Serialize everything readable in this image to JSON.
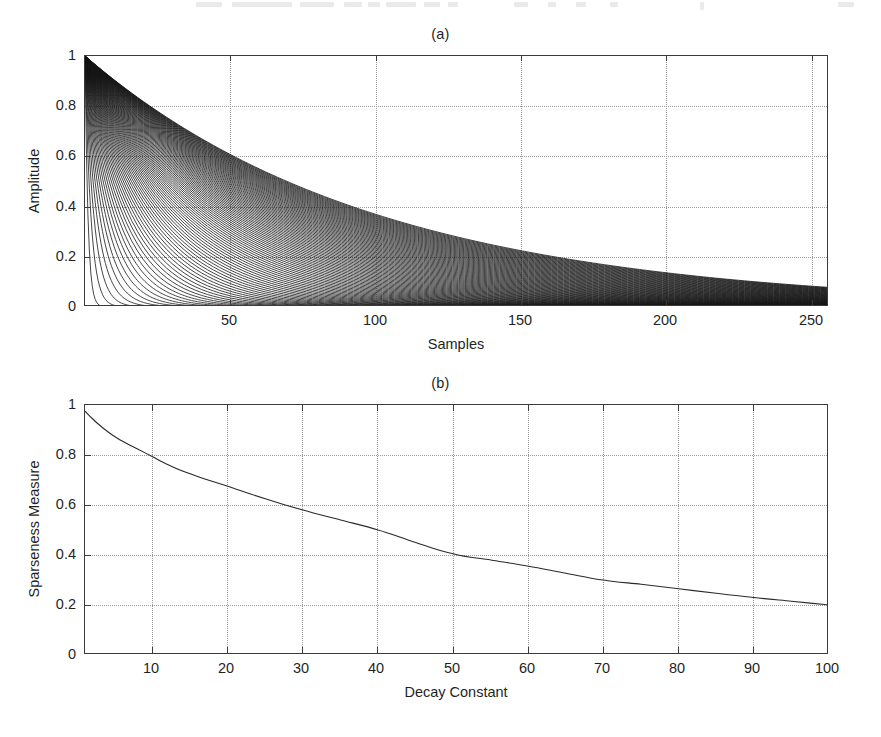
{
  "figure": {
    "background": "#ffffff",
    "axis_color": "#3b3b3b",
    "grid_color": "#9a9a9a",
    "curve_color": "#1a1a1a"
  },
  "panel_a": {
    "title": "(a)",
    "xlabel": "Samples",
    "ylabel": "Amplitude",
    "xticks": [
      "50",
      "100",
      "150",
      "200",
      "250"
    ],
    "yticks": [
      "0",
      "0.2",
      "0.4",
      "0.6",
      "0.8",
      "1"
    ]
  },
  "panel_b": {
    "title": "(b)",
    "xlabel": "Decay Constant",
    "ylabel": "Sparseness Measure",
    "xticks": [
      "10",
      "20",
      "30",
      "40",
      "50",
      "60",
      "70",
      "80",
      "90",
      "100"
    ],
    "yticks": [
      "0",
      "0.2",
      "0.4",
      "0.6",
      "0.8",
      "1"
    ]
  },
  "chart_data": [
    {
      "type": "line",
      "panel": "a",
      "title": "(a)",
      "xlabel": "Samples",
      "ylabel": "Amplitude",
      "xlim": [
        1,
        256
      ],
      "ylim": [
        0,
        1
      ],
      "xticks": [
        50,
        100,
        150,
        200,
        250
      ],
      "yticks": [
        0,
        0.2,
        0.4,
        0.6,
        0.8,
        1
      ],
      "grid": true,
      "legend": "none",
      "description": "Family of 100 exponential decay envelopes exp(-(n-1)/tau), tau = 1..100, each starting at amplitude 1 at sample 1; the slowest (tau=100) forms the upper envelope reaching about 0.08 at sample 256.",
      "series_count": 100,
      "series_model": "amplitude(n, tau) = exp(-(n-1)/tau)",
      "tau_values": [
        1,
        2,
        3,
        4,
        5,
        6,
        7,
        8,
        9,
        10,
        11,
        12,
        13,
        14,
        15,
        16,
        17,
        18,
        19,
        20,
        21,
        22,
        23,
        24,
        25,
        26,
        27,
        28,
        29,
        30,
        31,
        32,
        33,
        34,
        35,
        36,
        37,
        38,
        39,
        40,
        41,
        42,
        43,
        44,
        45,
        46,
        47,
        48,
        49,
        50,
        51,
        52,
        53,
        54,
        55,
        56,
        57,
        58,
        59,
        60,
        61,
        62,
        63,
        64,
        65,
        66,
        67,
        68,
        69,
        70,
        71,
        72,
        73,
        74,
        75,
        76,
        77,
        78,
        79,
        80,
        81,
        82,
        83,
        84,
        85,
        86,
        87,
        88,
        89,
        90,
        91,
        92,
        93,
        94,
        95,
        96,
        97,
        98,
        99,
        100
      ],
      "envelope_x": [
        1,
        25,
        50,
        75,
        100,
        125,
        150,
        175,
        200,
        225,
        256
      ],
      "envelope_y": [
        1.0,
        0.787,
        0.613,
        0.478,
        0.372,
        0.29,
        0.226,
        0.176,
        0.137,
        0.106,
        0.078
      ]
    },
    {
      "type": "line",
      "panel": "b",
      "title": "(b)",
      "xlabel": "Decay Constant",
      "ylabel": "Sparseness Measure",
      "xlim": [
        1,
        100
      ],
      "ylim": [
        0,
        1
      ],
      "xticks": [
        10,
        20,
        30,
        40,
        50,
        60,
        70,
        80,
        90,
        100
      ],
      "yticks": [
        0,
        0.2,
        0.4,
        0.6,
        0.8,
        1
      ],
      "grid": true,
      "legend": "none",
      "x": [
        1,
        2,
        3,
        4,
        5,
        6,
        8,
        10,
        12,
        15,
        20,
        25,
        30,
        35,
        40,
        45,
        50,
        55,
        60,
        65,
        70,
        75,
        80,
        85,
        90,
        95,
        100
      ],
      "y": [
        0.975,
        0.945,
        0.918,
        0.894,
        0.873,
        0.855,
        0.824,
        0.793,
        0.762,
        0.725,
        0.675,
        0.625,
        0.58,
        0.54,
        0.5,
        0.45,
        0.405,
        0.38,
        0.355,
        0.327,
        0.3,
        0.283,
        0.265,
        0.247,
        0.23,
        0.215,
        0.2
      ]
    }
  ]
}
